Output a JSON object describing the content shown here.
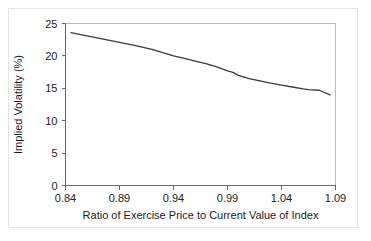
{
  "figure": {
    "background_color": "#ffffff",
    "border_color": "#e3e3e3",
    "axis_color": "#6a6a6a",
    "frame_color": "#b9b9b9"
  },
  "chart_data": {
    "type": "line",
    "title": "",
    "subtitle": "",
    "xlabel": "Ratio of Exercise Price to Current Value of Index",
    "ylabel": "Implied Volatility (%)",
    "xlim": [
      0.84,
      1.09
    ],
    "ylim": [
      0,
      25
    ],
    "xticks": [
      0.84,
      0.89,
      0.94,
      0.99,
      1.04,
      1.09
    ],
    "xtick_labels": [
      "0.84",
      "0.89",
      "0.94",
      "0.99",
      "1.04",
      "1.09"
    ],
    "yticks": [
      0,
      5,
      10,
      15,
      20,
      25
    ],
    "ytick_labels": [
      "0",
      "5",
      "10",
      "15",
      "20",
      "25"
    ],
    "grid": false,
    "legend": null,
    "legend_position": "none",
    "annotations": [],
    "series": [
      {
        "name": "Implied volatility skew",
        "color": "#3a3a3a",
        "x": [
          0.845,
          0.86,
          0.875,
          0.89,
          0.905,
          0.92,
          0.93,
          0.94,
          0.95,
          0.96,
          0.97,
          0.98,
          0.99,
          0.995,
          1.0,
          1.01,
          1.02,
          1.03,
          1.04,
          1.05,
          1.06,
          1.065,
          1.075,
          1.085
        ],
        "y": [
          23.6,
          23.1,
          22.6,
          22.1,
          21.6,
          21.0,
          20.5,
          20.0,
          19.6,
          19.2,
          18.8,
          18.3,
          17.7,
          17.45,
          17.0,
          16.5,
          16.15,
          15.8,
          15.5,
          15.2,
          14.9,
          14.8,
          14.7,
          14.0
        ]
      }
    ]
  }
}
